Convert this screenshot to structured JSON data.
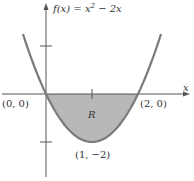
{
  "chart_data": {
    "type": "line",
    "title": "",
    "function_label": {
      "prefix": "f(x)",
      "eq": " = x",
      "exp": "2",
      "rest": " − 2x"
    },
    "xlabel": "x",
    "ylabel": "",
    "xlim": [
      -1,
      3
    ],
    "ylim": [
      -3.5,
      4
    ],
    "series": [
      {
        "name": "f(x) = x^2 - 2x",
        "x": [
          -1.5,
          0,
          1,
          2,
          3.5
        ],
        "y": [
          2.5,
          0,
          -2,
          0,
          2.5
        ]
      }
    ],
    "shaded_region": {
      "label": "R",
      "from_x": 0,
      "to_x": 2,
      "between": "curve and x-axis"
    },
    "x_ticks": [
      1
    ],
    "y_ticks": [
      2,
      -2
    ],
    "points": [
      {
        "label": "(0, 0)",
        "x": 0,
        "y": 0
      },
      {
        "label": "(2, 0)",
        "x": 2,
        "y": 0
      },
      {
        "label": "(1, −2)",
        "x": 1,
        "y": -2
      }
    ],
    "colors": {
      "curve": "#7a7a7a",
      "fill": "#b8b8b8",
      "axis": "#555555"
    }
  }
}
